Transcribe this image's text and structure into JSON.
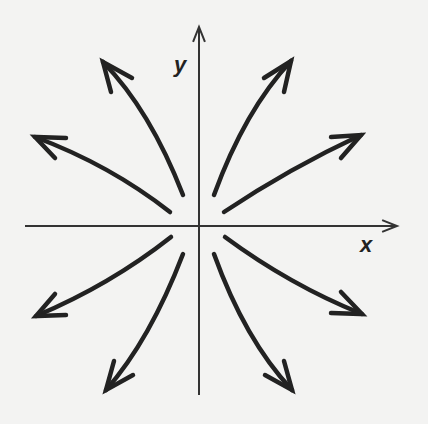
{
  "diagram": {
    "type": "phase-portrait",
    "colors": {
      "background": "#f3f3f2",
      "ink": "#222222",
      "axis": "#333333"
    },
    "axes": {
      "x": {
        "label": "x",
        "from": [
          25,
          226
        ],
        "to": [
          397,
          226
        ]
      },
      "y": {
        "label": "y",
        "from": [
          199,
          395
        ],
        "to": [
          199,
          27
        ]
      },
      "origin": [
        199,
        226
      ]
    },
    "labels": {
      "x": {
        "text": "x",
        "pos": [
          360,
          252
        ]
      },
      "y": {
        "text": "y",
        "pos": [
          174,
          72
        ]
      }
    },
    "arrows": [
      {
        "name": "upper-left-steep",
        "start": [
          183,
          195
        ],
        "ctrl": [
          150,
          110
        ],
        "end": [
          103,
          62
        ],
        "head": [
          [
            111,
            92
          ],
          [
            103,
            62
          ],
          [
            132,
            78
          ]
        ]
      },
      {
        "name": "upper-left-shallow",
        "start": [
          170,
          212
        ],
        "ctrl": [
          110,
          165
        ],
        "end": [
          35,
          137
        ],
        "head": [
          [
            55,
            158
          ],
          [
            35,
            137
          ],
          [
            66,
            138
          ]
        ]
      },
      {
        "name": "upper-right-steep",
        "start": [
          214,
          195
        ],
        "ctrl": [
          245,
          110
        ],
        "end": [
          291,
          61
        ],
        "head": [
          [
            264,
            78
          ],
          [
            291,
            61
          ],
          [
            284,
            92
          ]
        ]
      },
      {
        "name": "upper-right-shallow",
        "start": [
          224,
          212
        ],
        "ctrl": [
          290,
          168
        ],
        "end": [
          361,
          135
        ],
        "head": [
          [
            331,
            137
          ],
          [
            361,
            135
          ],
          [
            341,
            158
          ]
        ]
      },
      {
        "name": "lower-left-shallow",
        "start": [
          171,
          237
        ],
        "ctrl": [
          110,
          285
        ],
        "end": [
          36,
          316
        ],
        "head": [
          [
            55,
            294
          ],
          [
            36,
            316
          ],
          [
            66,
            315
          ]
        ]
      },
      {
        "name": "lower-left-steep",
        "start": [
          183,
          254
        ],
        "ctrl": [
          150,
          340
        ],
        "end": [
          106,
          390
        ],
        "head": [
          [
            114,
            361
          ],
          [
            106,
            390
          ],
          [
            133,
            375
          ]
        ]
      },
      {
        "name": "lower-right-shallow",
        "start": [
          225,
          237
        ],
        "ctrl": [
          290,
          285
        ],
        "end": [
          362,
          314
        ],
        "head": [
          [
            341,
            292
          ],
          [
            362,
            314
          ],
          [
            331,
            313
          ]
        ]
      },
      {
        "name": "lower-right-steep",
        "start": [
          214,
          254
        ],
        "ctrl": [
          245,
          340
        ],
        "end": [
          292,
          390
        ],
        "head": [
          [
            265,
            375
          ],
          [
            292,
            390
          ],
          [
            284,
            361
          ]
        ]
      }
    ]
  }
}
